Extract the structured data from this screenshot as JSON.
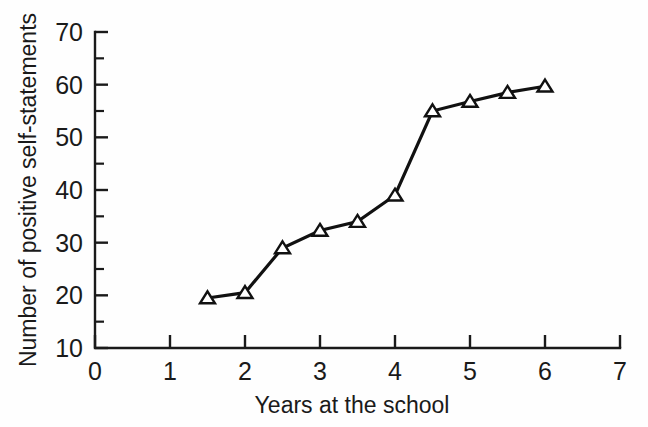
{
  "chart_data": {
    "type": "line",
    "title": "",
    "xlabel": "Years at the school",
    "ylabel": "Number of positive self-statements",
    "xlim": [
      0,
      7
    ],
    "ylim": [
      10,
      70
    ],
    "grid": false,
    "legend": "none",
    "marker": "open-triangle-up",
    "line_color": "#111111",
    "marker_fill": "#ffffff",
    "marker_edge": "#111111",
    "background": "#ffffff",
    "x_ticks": [
      0,
      1,
      2,
      3,
      4,
      5,
      6,
      7
    ],
    "x_tick_labels": [
      "0",
      "1",
      "2",
      "3",
      "4",
      "5",
      "6",
      "7"
    ],
    "x_minor_ticks": [],
    "y_ticks": [
      10,
      20,
      30,
      40,
      50,
      60,
      70
    ],
    "y_tick_labels": [
      "10",
      "20",
      "30",
      "40",
      "50",
      "60",
      "70"
    ],
    "y_minor_ticks": [
      15,
      25,
      35,
      45,
      55,
      65
    ],
    "x": [
      1.5,
      2.0,
      2.5,
      3.0,
      3.5,
      4.0,
      4.5,
      5.0,
      5.5,
      6.0
    ],
    "values": [
      19.5,
      20.5,
      29.0,
      32.3,
      34.0,
      39.0,
      55.0,
      56.8,
      58.5,
      59.7
    ],
    "points": [
      {
        "x": 1.5,
        "y": 19.5
      },
      {
        "x": 2.0,
        "y": 20.5
      },
      {
        "x": 2.5,
        "y": 29.0
      },
      {
        "x": 3.0,
        "y": 32.3
      },
      {
        "x": 3.5,
        "y": 34.0
      },
      {
        "x": 4.0,
        "y": 39.0
      },
      {
        "x": 4.5,
        "y": 55.0
      },
      {
        "x": 5.0,
        "y": 56.8
      },
      {
        "x": 5.5,
        "y": 58.5
      },
      {
        "x": 6.0,
        "y": 59.7
      }
    ]
  },
  "geometry": {
    "x0_px": 95,
    "x7_px": 620,
    "y10_px": 348,
    "y70_px": 32,
    "major_tick_len": 13,
    "minor_tick_len": 9
  }
}
